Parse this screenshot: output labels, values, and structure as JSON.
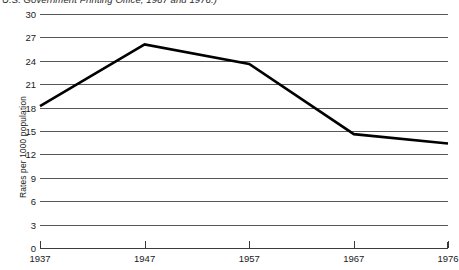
{
  "source_caption": "U.S. Government Printing Office, 1967 and 1976.)",
  "chart_data": {
    "type": "line",
    "title": "",
    "subtitle": "",
    "xlabel": "",
    "ylabel": "Rates per 1000 population",
    "x": [
      1937,
      1947,
      1957,
      1967,
      1976
    ],
    "categories": [
      "1937",
      "1947",
      "1957",
      "1967",
      "1976"
    ],
    "values": [
      18.2,
      26.1,
      23.6,
      14.6,
      13.4
    ],
    "series": [
      {
        "name": "Rates per 1000 population",
        "values": [
          18.2,
          26.1,
          23.6,
          14.6,
          13.4
        ]
      }
    ],
    "xlim": [
      1937,
      1976
    ],
    "ylim": [
      0,
      30
    ],
    "ytick_values": [
      0,
      3,
      6,
      9,
      12,
      15,
      18,
      21,
      24,
      27,
      30
    ],
    "ytick_labels": [
      "0",
      "3",
      "6",
      "9",
      "12",
      "15",
      "18",
      "21",
      "24",
      "27",
      "30"
    ],
    "xtick_labels": [
      "1937",
      "1947",
      "1957",
      "1967",
      "1976"
    ],
    "grid": true,
    "grid_axis": "y",
    "legend": false,
    "legend_position": "none",
    "line_color": "#000000",
    "grid_color": "#575757",
    "axis_color": "#3a3a3a",
    "background_color": "#ffffff",
    "annotations": []
  }
}
